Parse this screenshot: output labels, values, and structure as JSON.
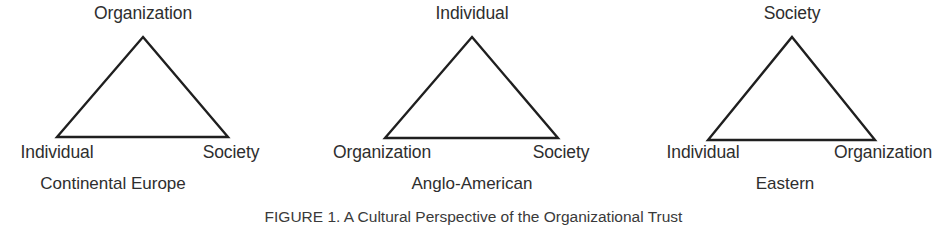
{
  "figure": {
    "caption": "FIGURE 1. A Cultural Perspective of the Organizational Trust",
    "stroke_color": "#1f1f1f",
    "text_color": "#2e2e2e",
    "background_color": "#ffffff"
  },
  "panels": [
    {
      "id": "continental-europe",
      "caption": "Continental Europe",
      "apex": "Organization",
      "base_left": "Individual",
      "base_right": "Society"
    },
    {
      "id": "anglo-american",
      "caption": "Anglo-American",
      "apex": "Individual",
      "base_left": "Organization",
      "base_right": "Society"
    },
    {
      "id": "eastern",
      "caption": "Eastern",
      "apex": "Society",
      "base_left": "Individual",
      "base_right": "Organization"
    }
  ]
}
